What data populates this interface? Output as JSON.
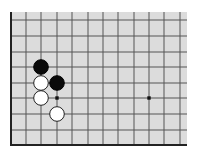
{
  "diagram": {
    "type": "go-board-partial",
    "board_color": "#dcdcdc",
    "line_color": "#555555",
    "edge_color": "#222222",
    "grid": {
      "x_lines": [
        26,
        41,
        57,
        72,
        88,
        103,
        118,
        134,
        149,
        164,
        180
      ],
      "y_lines": [
        20,
        36,
        52,
        67,
        83,
        98,
        114,
        130
      ],
      "left_edge_x": 11,
      "bottom_edge_y": 145,
      "top_y": 12,
      "right_x": 187
    },
    "hoshi": [
      {
        "x": 57,
        "y": 98
      },
      {
        "x": 149,
        "y": 98
      }
    ],
    "stones": [
      {
        "color": "black",
        "x": 41,
        "y": 67
      },
      {
        "color": "black",
        "x": 57,
        "y": 83
      },
      {
        "color": "white",
        "x": 41,
        "y": 83
      },
      {
        "color": "white",
        "x": 41,
        "y": 98
      },
      {
        "color": "white",
        "x": 57,
        "y": 114
      }
    ],
    "stone_radius": 7.3
  }
}
